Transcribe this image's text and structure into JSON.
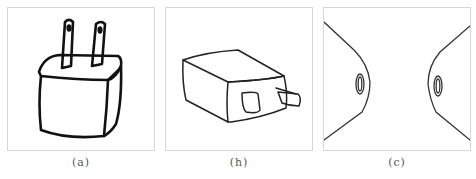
{
  "figure": {
    "panels": [
      {
        "id": "a",
        "caption": "(a)",
        "subject": "charger plug drawn upright with two prongs on top (hand-drawn sketch)"
      },
      {
        "id": "b",
        "caption": "(h)",
        "subject": "charger block lying on its side, prongs pointing right (line drawing)"
      },
      {
        "id": "c",
        "caption": "(c)",
        "subject": "abstract outline: two mirrored curved shapes with oval holes"
      }
    ]
  },
  "colors": {
    "border": "#d6d6d6",
    "stroke_a": "#111111",
    "stroke_b": "#222222",
    "stroke_c": "#333333",
    "caption": "#555555"
  }
}
